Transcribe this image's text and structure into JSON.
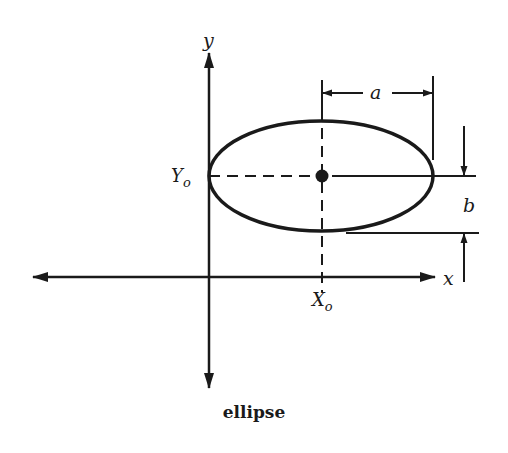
{
  "figure": {
    "caption": "ellipse",
    "colors": {
      "ink": "#1a1a1a",
      "background": "#ffffff"
    }
  },
  "axes": {
    "x_label": "x",
    "y_label": "y"
  },
  "center": {
    "x_label": "X",
    "x_sub": "o",
    "y_label": "Y",
    "y_sub": "o"
  },
  "dimensions": {
    "semi_major_label": "a",
    "semi_minor_label": "b"
  }
}
